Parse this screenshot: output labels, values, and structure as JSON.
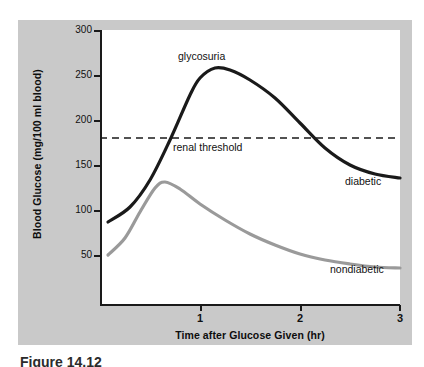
{
  "figure": {
    "caption": "Figure 14.12"
  },
  "chart_data": {
    "type": "line",
    "title": "",
    "xlabel": "Time after Glucose Given (hr)",
    "ylabel": "Blood Glucose (mg/100 ml blood)",
    "xlim": [
      0,
      3
    ],
    "ylim": [
      25,
      300
    ],
    "xticks": [
      1,
      2,
      3
    ],
    "xticklabels": [
      "1",
      "2",
      "3"
    ],
    "yticks": [
      50,
      100,
      150,
      200,
      250,
      300
    ],
    "yticklabels": [
      "50",
      "100",
      "150",
      "200",
      "250",
      "300"
    ],
    "grid": false,
    "legend": "inline-annotations",
    "series": [
      {
        "name": "diabetic",
        "label": "diabetic",
        "color": "#1a1a1a",
        "linewidth": 3.2,
        "x": [
          0.08,
          0.3,
          0.5,
          0.7,
          0.9,
          1.0,
          1.15,
          1.3,
          1.5,
          1.75,
          2.0,
          2.25,
          2.5,
          2.75,
          3.0
        ],
        "values": [
          108,
          123,
          150,
          190,
          235,
          252,
          262,
          260,
          250,
          232,
          207,
          182,
          165,
          156,
          152
        ]
      },
      {
        "name": "nondiabetic",
        "label": "nondiabetic",
        "color": "#9a9a9a",
        "linewidth": 3.2,
        "x": [
          0.08,
          0.25,
          0.4,
          0.55,
          0.65,
          0.8,
          1.0,
          1.25,
          1.5,
          1.75,
          2.0,
          2.25,
          2.5,
          2.75,
          3.0
        ],
        "values": [
          75,
          92,
          118,
          142,
          148,
          141,
          126,
          110,
          96,
          85,
          76,
          70,
          66,
          63,
          62
        ]
      }
    ],
    "annotations": [
      {
        "name": "glycosuria",
        "text": "glycosuria",
        "x": 1.0,
        "y": 278
      },
      {
        "name": "renal-threshold",
        "text": "renal threshold",
        "x": 1.0,
        "y": 182
      }
    ],
    "reference_lines": [
      {
        "name": "renal-threshold-line",
        "label": "renal threshold",
        "value": 192,
        "orientation": "horizontal",
        "style": "dashed",
        "color": "#1a1a1a"
      }
    ],
    "colors": {
      "diabetic": "#1a1a1a",
      "nondiabetic": "#9a9a9a",
      "panel_background": "#c9c9c9",
      "plot_background": "#ffffff",
      "axis": "#1a1a1a"
    }
  }
}
